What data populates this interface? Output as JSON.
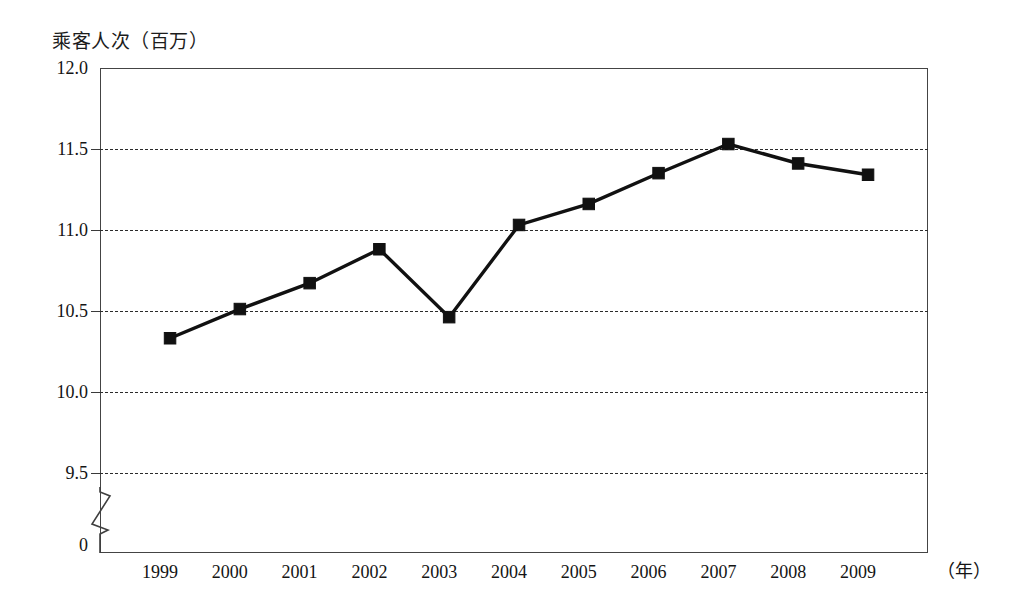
{
  "chart_data": {
    "type": "line",
    "title": "",
    "ylabel": "乘客人次（百万）",
    "xlabel": "（年）",
    "categories": [
      "1999",
      "2000",
      "2001",
      "2002",
      "2003",
      "2004",
      "2005",
      "2006",
      "2007",
      "2008",
      "2009"
    ],
    "values": [
      10.33,
      10.51,
      10.67,
      10.88,
      10.46,
      11.03,
      11.16,
      11.35,
      11.53,
      11.41,
      11.34
    ],
    "series": [
      {
        "name": "乘客人次",
        "values": [
          10.33,
          10.51,
          10.67,
          10.88,
          10.46,
          11.03,
          11.16,
          11.35,
          11.53,
          11.41,
          11.34
        ]
      }
    ],
    "ytick_labels": [
      "12.0",
      "11.5",
      "11.0",
      "10.5",
      "10.0",
      "9.5",
      "0"
    ],
    "ytick_values": [
      12.0,
      11.5,
      11.0,
      10.5,
      10.0,
      9.5,
      0
    ],
    "ylim": [
      9.5,
      12.0
    ],
    "y_axis_break": true,
    "grid": true,
    "gridline_values": [
      11.5,
      11.0,
      10.5,
      10.0,
      9.5
    ],
    "legend": "none",
    "marker": "square",
    "line_color": "#111111",
    "marker_color": "#111111",
    "grid_color": "#2b2b2b",
    "frame_color": "#444444",
    "background": "#ffffff"
  },
  "axes": {
    "y_title": "乘客人次（百万）",
    "x_unit": "（年）",
    "y_ticks": [
      {
        "label": "12.0",
        "value": 12.0
      },
      {
        "label": "11.5",
        "value": 11.5
      },
      {
        "label": "11.0",
        "value": 11.0
      },
      {
        "label": "10.5",
        "value": 10.5
      },
      {
        "label": "10.0",
        "value": 10.0
      },
      {
        "label": "9.5",
        "value": 9.5
      },
      {
        "label": "0",
        "value": 0
      }
    ],
    "x_ticks": [
      {
        "label": "1999"
      },
      {
        "label": "2000"
      },
      {
        "label": "2001"
      },
      {
        "label": "2002"
      },
      {
        "label": "2003"
      },
      {
        "label": "2004"
      },
      {
        "label": "2005"
      },
      {
        "label": "2006"
      },
      {
        "label": "2007"
      },
      {
        "label": "2008"
      },
      {
        "label": "2009"
      }
    ]
  }
}
